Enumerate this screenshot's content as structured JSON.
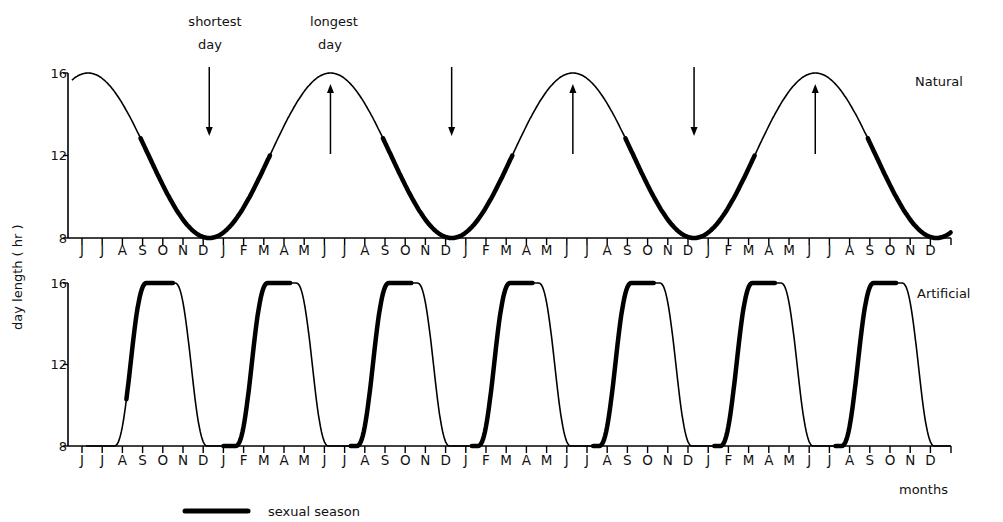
{
  "chart_data": {
    "type": "line",
    "title": "",
    "ylabel": "day length ( hr )",
    "xlabel": "months",
    "legend": [
      {
        "label": "sexual season",
        "style": "thick line"
      }
    ],
    "months_axis": [
      "J",
      "J",
      "A",
      "S",
      "O",
      "N",
      "D",
      "J",
      "F",
      "M",
      "A",
      "M",
      "J",
      "J",
      "A",
      "S",
      "O",
      "N",
      "D",
      "J",
      "F",
      "M",
      "A",
      "M",
      "J",
      "J",
      "A",
      "S",
      "O",
      "N",
      "D",
      "J",
      "F",
      "M",
      "A",
      "M",
      "J",
      "J",
      "A",
      "S",
      "O",
      "N",
      "D"
    ],
    "panels": [
      {
        "name": "Natural",
        "ylim": [
          8,
          16
        ],
        "yticks": [
          8,
          12,
          16
        ],
        "period_months": 12,
        "description": "Annual sinusoidal photoperiod, max 16 hr (late June), min 8 hr (late December)",
        "peaks_month_index": [
          0.3,
          12.3,
          24.3,
          36.3
        ],
        "troughs_month_index": [
          6.3,
          18.3,
          30.3,
          42.3
        ],
        "sexual_season_segments_month_index": [
          [
            2.9,
            9.3
          ],
          [
            14.9,
            21.3
          ],
          [
            26.9,
            33.3
          ],
          [
            38.9,
            43
          ]
        ],
        "annotations": [
          {
            "text": "shortest day",
            "arrow": "down",
            "month_index": 6.3
          },
          {
            "text": "longest day",
            "arrow": "up",
            "month_index": 12.3
          },
          {
            "text": "",
            "arrow": "down",
            "month_index": 18.3
          },
          {
            "text": "",
            "arrow": "up",
            "month_index": 24.3
          },
          {
            "text": "",
            "arrow": "down",
            "month_index": 30.3
          },
          {
            "text": "",
            "arrow": "up",
            "month_index": 36.3
          }
        ]
      },
      {
        "name": "Artificial",
        "ylim": [
          8,
          16
        ],
        "yticks": [
          8,
          12,
          16
        ],
        "period_months": 6,
        "description": "Compressed 6-month photoperiod cycle, max 16 hr, min 8 hr",
        "peaks_month_index": [
          3.9,
          9.9,
          15.9,
          21.9,
          27.9,
          33.9,
          39.9
        ],
        "troughs_month_index": [
          0.6,
          6.9,
          12.9,
          18.9,
          24.9,
          30.9,
          36.9,
          42.9
        ],
        "sexual_season_segments_month_index": [
          [
            2.2,
            4.5
          ],
          [
            7.0,
            10.3
          ],
          [
            13.3,
            16.3
          ],
          [
            19.3,
            22.3
          ],
          [
            25.3,
            28.3
          ],
          [
            31.3,
            34.3
          ],
          [
            37.3,
            40.3
          ]
        ]
      }
    ]
  },
  "labels": {
    "shortest": "shortest",
    "shortest_day": "day",
    "longest": "longest",
    "longest_day": "day",
    "natural": "Natural",
    "artificial": "Artificial",
    "ylabel": "day length ( hr )",
    "months": "months",
    "legend": "sexual season",
    "y16": "16",
    "y12": "12",
    "y8": "8"
  }
}
